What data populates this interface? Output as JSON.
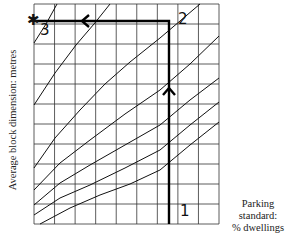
{
  "chart_data": {
    "type": "line",
    "title": "",
    "ylabel": "Average block dimension: metres",
    "xlabel_line1": "Parking standard:",
    "xlabel_line2": "% dwellings",
    "grid": true,
    "grid_columns": 9,
    "grid_rows": 11,
    "axis_ticks": "none labelled",
    "series": [
      {
        "name": "curve-1",
        "points": [
          [
            34,
            43
          ],
          [
            46,
            24
          ],
          [
            57,
            4
          ]
        ]
      },
      {
        "name": "curve-2",
        "points": [
          [
            34,
            105
          ],
          [
            55,
            73
          ],
          [
            76,
            45
          ],
          [
            94,
            24
          ],
          [
            110,
            4
          ]
        ]
      },
      {
        "name": "curve-3",
        "points": [
          [
            34,
            168
          ],
          [
            55,
            138
          ],
          [
            80,
            110
          ],
          [
            105,
            84
          ],
          [
            130,
            62
          ],
          [
            160,
            38
          ],
          [
            200,
            4
          ]
        ]
      },
      {
        "name": "curve-4",
        "points": [
          [
            34,
            190
          ],
          [
            60,
            163
          ],
          [
            90,
            140
          ],
          [
            125,
            114
          ],
          [
            160,
            90
          ],
          [
            190,
            64
          ],
          [
            219,
            36
          ]
        ]
      },
      {
        "name": "curve-5",
        "points": [
          [
            34,
            205
          ],
          [
            60,
            183
          ],
          [
            90,
            165
          ],
          [
            125,
            145
          ],
          [
            160,
            125
          ],
          [
            190,
            100
          ],
          [
            219,
            78
          ]
        ]
      },
      {
        "name": "curve-6",
        "points": [
          [
            34,
            215
          ],
          [
            60,
            198
          ],
          [
            90,
            185
          ],
          [
            125,
            168
          ],
          [
            160,
            150
          ],
          [
            190,
            125
          ],
          [
            219,
            102
          ]
        ]
      },
      {
        "name": "curve-7",
        "points": [
          [
            40,
            224
          ],
          [
            70,
            208
          ],
          [
            100,
            195
          ],
          [
            130,
            184
          ],
          [
            160,
            170
          ],
          [
            190,
            145
          ],
          [
            219,
            122
          ]
        ]
      }
    ],
    "route": {
      "points": [
        [
          169,
          224
        ],
        [
          169,
          21
        ],
        [
          34,
          21
        ]
      ],
      "labels": [
        {
          "text": "1",
          "x": 181,
          "y": 212
        },
        {
          "text": "2",
          "x": 180,
          "y": 17
        },
        {
          "text": "3",
          "x": 42,
          "y": 30
        }
      ],
      "start_marker": "1",
      "end_marker": "star"
    }
  },
  "labels": {
    "point_1": "1",
    "point_2": "2",
    "point_3": "3",
    "star": "✱"
  }
}
